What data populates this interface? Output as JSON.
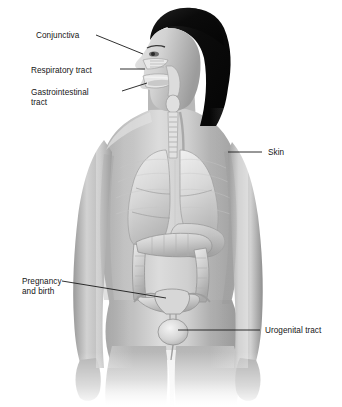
{
  "diagram": {
    "palette": {
      "background": "#ffffff",
      "skin_light": "#d8d8d8",
      "skin_mid": "#b4b4b4",
      "skin_shadow": "#8c8c8c",
      "skin_deep_shadow": "#6a6a6a",
      "hair": "#0d0d0d",
      "organ_light": "#e3e3e3",
      "organ_mid": "#c2c2c2",
      "organ_outline": "#8f8f8f",
      "leader_line": "#1a1a1a",
      "text": "#161616"
    },
    "labels": [
      {
        "id": "conjunctiva",
        "text": "Conjunctiva",
        "lines": [
          "Conjunctiva"
        ],
        "text_x": 36,
        "text_y": 31,
        "leader": {
          "x1": 96,
          "y1": 35,
          "x2": 143,
          "y2": 54
        },
        "target": "eye / conjunctival membrane"
      },
      {
        "id": "respiratory-tract",
        "text": "Respiratory tract",
        "lines": [
          "Respiratory tract"
        ],
        "text_x": 31,
        "text_y": 66,
        "leader": {
          "x1": 120,
          "y1": 69,
          "x2": 145,
          "y2": 69
        },
        "target": "nasal cavity / trachea"
      },
      {
        "id": "gastrointestinal-tract",
        "text": "Gastrointestinal tract",
        "lines": [
          "Gastrointestinal",
          "tract"
        ],
        "text_x": 31,
        "text_y": 88,
        "leader": {
          "x1": 122,
          "y1": 91,
          "x2": 147,
          "y2": 83
        },
        "target": "oral cavity / esophagus"
      },
      {
        "id": "skin",
        "text": "Skin",
        "lines": [
          "Skin"
        ],
        "text_x": 268,
        "text_y": 148,
        "leader": {
          "x1": 228,
          "y1": 152,
          "x2": 262,
          "y2": 152
        },
        "target": "shoulder skin surface"
      },
      {
        "id": "pregnancy-and-birth",
        "text": "Pregnancy and birth",
        "lines": [
          "Pregnancy",
          "and birth"
        ],
        "text_x": 22,
        "text_y": 277,
        "leader": {
          "x1": 62,
          "y1": 281,
          "x2": 166,
          "y2": 298
        },
        "target": "uterus"
      },
      {
        "id": "urogenital-tract",
        "text": "Urogenital tract",
        "lines": [
          "Urogenital tract"
        ],
        "text_x": 265,
        "text_y": 326,
        "leader": {
          "x1": 178,
          "y1": 330,
          "x2": 260,
          "y2": 330
        },
        "target": "bladder / urogenital opening"
      }
    ],
    "organs": [
      {
        "id": "nasal-cavity",
        "label": "nasal cavity"
      },
      {
        "id": "oral-cavity",
        "label": "oral cavity"
      },
      {
        "id": "trachea",
        "label": "trachea"
      },
      {
        "id": "esophagus",
        "label": "esophagus"
      },
      {
        "id": "right-lung",
        "label": "right lung"
      },
      {
        "id": "left-lung",
        "label": "left lung"
      },
      {
        "id": "liver",
        "label": "liver"
      },
      {
        "id": "colon",
        "label": "large intestine / colon"
      },
      {
        "id": "uterus",
        "label": "uterus"
      },
      {
        "id": "bladder",
        "label": "urinary bladder"
      }
    ]
  }
}
